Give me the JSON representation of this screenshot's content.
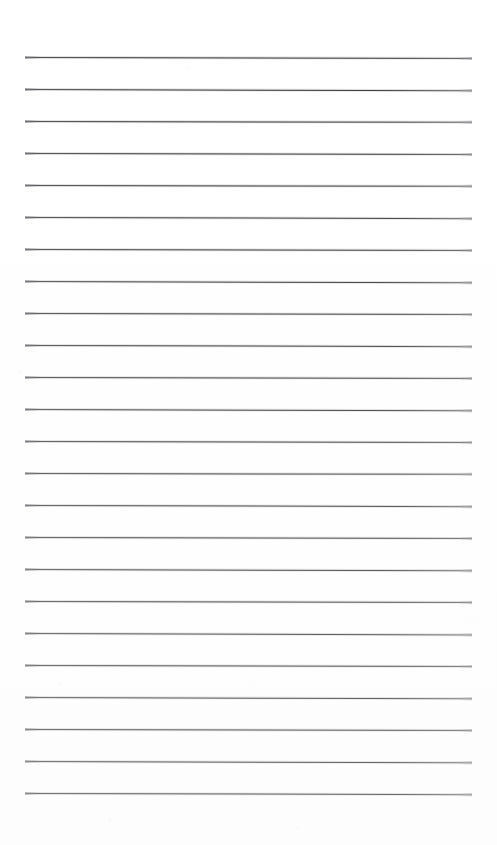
{
  "document": {
    "title": "Lined Paper",
    "kind": "scanned-ruled-notepaper",
    "page_width_px": 497,
    "page_height_px": 845,
    "background_color": "#ffffff",
    "line_color": "#3a3a3e",
    "line_count": 24,
    "line_thickness_px": 1,
    "line_spacing_px": 32,
    "first_line_y_px": 57,
    "last_line_y_px": 793,
    "margin_left_px": 25,
    "margin_right_px": 25,
    "line_start_x_px": 25,
    "line_end_x_px": 472,
    "line_length_px": 447,
    "top_margin_px": 57,
    "bottom_margin_px": 52,
    "text_content": "",
    "has_header_text": false,
    "has_margin_rule": false,
    "has_holes": false
  },
  "rules": [
    {
      "index": 1,
      "y": 57,
      "tilt_deg": 0.12
    },
    {
      "index": 2,
      "y": 89,
      "tilt_deg": 0.16
    },
    {
      "index": 3,
      "y": 121,
      "tilt_deg": 0.1
    },
    {
      "index": 4,
      "y": 153,
      "tilt_deg": 0.14
    },
    {
      "index": 5,
      "y": 185,
      "tilt_deg": 0.11
    },
    {
      "index": 6,
      "y": 217,
      "tilt_deg": 0.15
    },
    {
      "index": 7,
      "y": 249,
      "tilt_deg": 0.12
    },
    {
      "index": 8,
      "y": 281,
      "tilt_deg": 0.17
    },
    {
      "index": 9,
      "y": 313,
      "tilt_deg": 0.13
    },
    {
      "index": 10,
      "y": 345,
      "tilt_deg": 0.15
    },
    {
      "index": 11,
      "y": 377,
      "tilt_deg": 0.12
    },
    {
      "index": 12,
      "y": 409,
      "tilt_deg": 0.16
    },
    {
      "index": 13,
      "y": 441,
      "tilt_deg": 0.14
    },
    {
      "index": 14,
      "y": 473,
      "tilt_deg": 0.11
    },
    {
      "index": 15,
      "y": 505,
      "tilt_deg": 0.15
    },
    {
      "index": 16,
      "y": 537,
      "tilt_deg": 0.13
    },
    {
      "index": 17,
      "y": 569,
      "tilt_deg": 0.16
    },
    {
      "index": 18,
      "y": 601,
      "tilt_deg": 0.12
    },
    {
      "index": 19,
      "y": 633,
      "tilt_deg": 0.18
    },
    {
      "index": 20,
      "y": 665,
      "tilt_deg": 0.14
    },
    {
      "index": 21,
      "y": 697,
      "tilt_deg": 0.16
    },
    {
      "index": 22,
      "y": 729,
      "tilt_deg": 0.13
    },
    {
      "index": 23,
      "y": 761,
      "tilt_deg": 0.17
    },
    {
      "index": 24,
      "y": 793,
      "tilt_deg": 0.15
    }
  ]
}
